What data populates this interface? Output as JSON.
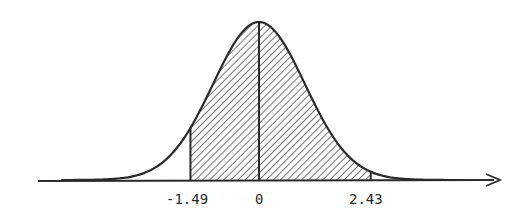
{
  "diagram": {
    "type": "normal-distribution",
    "shaded_region": {
      "from": -1.49,
      "to": 2.43
    },
    "center_line": 0,
    "labels": [
      "-1.49",
      "0",
      "2.43"
    ],
    "colors": {
      "ink": "#2a2a2a",
      "background": "#ffffff"
    }
  }
}
